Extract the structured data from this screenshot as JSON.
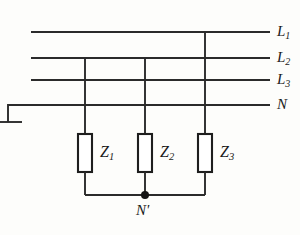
{
  "diagram": {
    "stroke_color": "#2b2b2b",
    "background_color": "#fdfdfb",
    "bus_lines": [
      {
        "id": "L1",
        "label": "L",
        "subscript": "1",
        "y": 32,
        "x_start": 31,
        "x_end": 270
      },
      {
        "id": "L2",
        "label": "L",
        "subscript": "2",
        "y": 58,
        "x_start": 31,
        "x_end": 270
      },
      {
        "id": "L3",
        "label": "L",
        "subscript": "3",
        "y": 80,
        "x_start": 31,
        "x_end": 270
      },
      {
        "id": "N",
        "label": "N",
        "subscript": "",
        "y": 105,
        "x_start": 8,
        "x_end": 270
      }
    ],
    "impedances": [
      {
        "id": "Z1",
        "label": "Z",
        "subscript": "1",
        "x": 85,
        "connects_to": "L2"
      },
      {
        "id": "Z2",
        "label": "Z",
        "subscript": "2",
        "x": 145,
        "connects_to": "L2"
      },
      {
        "id": "Z3",
        "label": "Z",
        "subscript": "3",
        "x": 205,
        "connects_to": "L1"
      }
    ],
    "star_point": {
      "label": "N'",
      "x": 145,
      "y": 195
    },
    "ground": {
      "x": 8,
      "y_top": 105,
      "y_bar": 122,
      "bar_half_width": 14
    }
  }
}
